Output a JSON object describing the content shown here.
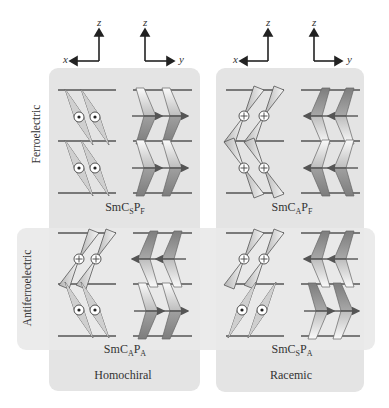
{
  "axes": [
    {
      "horizontal": "x",
      "vertical": "z",
      "horizontal_direction": "left"
    },
    {
      "horizontal": "y",
      "vertical": "z",
      "horizontal_direction": "right"
    },
    {
      "horizontal": "x",
      "vertical": "z",
      "horizontal_direction": "left"
    },
    {
      "horizontal": "y",
      "vertical": "z",
      "horizontal_direction": "right"
    }
  ],
  "rows": {
    "ferroelectric": "Ferroelectric",
    "antiferroelectric": "Antiferroelectric"
  },
  "columns": {
    "homochiral": "Homochiral",
    "racemic": "Racemic"
  },
  "phases": {
    "homo_ferro": {
      "base": "SmC",
      "sub1": "S",
      "mid": "P",
      "sub2": "F"
    },
    "racemic_ferro": {
      "base": "SmC",
      "sub1": "A",
      "mid": "P",
      "sub2": "F"
    },
    "homo_antiferro": {
      "base": "SmC",
      "sub1": "A",
      "mid": "P",
      "sub2": "A"
    },
    "racemic_antiferro": {
      "base": "SmC",
      "sub1": "S",
      "mid": "P",
      "sub2": "A"
    }
  },
  "colors": {
    "panel": "#e4e4e4",
    "layer_line": "#555555",
    "molecule_light": "#f4f4f4",
    "molecule_dark": "#8c8c8c",
    "arrow": "#555555"
  }
}
